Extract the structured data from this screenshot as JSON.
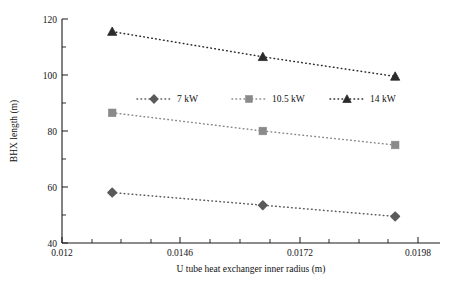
{
  "chart_data": {
    "type": "line",
    "title": "",
    "xlabel": "U tube heat exchanger inner radius (m)",
    "ylabel": "BHX length (m)",
    "x": [
      0.0131,
      0.0164,
      0.0193
    ],
    "xlim": [
      0.012,
      0.0198
    ],
    "ylim": [
      40,
      120
    ],
    "xticks": [
      "0.012",
      "0.0146",
      "0.0172",
      "0.0198"
    ],
    "xtick_values": [
      0.012,
      0.0146,
      0.0172,
      0.0198
    ],
    "yticks": [
      "40",
      "60",
      "80",
      "100",
      "120"
    ],
    "ytick_values": [
      40,
      60,
      80,
      100,
      120
    ],
    "grid": false,
    "legend_position": "center",
    "series": [
      {
        "name": "7 kW",
        "marker": "diamond",
        "color": "#5a5a5a",
        "values": [
          58,
          53.5,
          49.5
        ]
      },
      {
        "name": "10.5 kW",
        "marker": "square",
        "color": "#8a8a8a",
        "values": [
          86.5,
          80,
          75
        ]
      },
      {
        "name": "14 kW",
        "marker": "triangle",
        "color": "#2b2b2b",
        "values": [
          115.5,
          106.5,
          99.5
        ]
      }
    ]
  },
  "legend": {
    "items": [
      {
        "label": "7 kW",
        "marker": "diamond-marker-icon"
      },
      {
        "label": "10.5 kW",
        "marker": "square-marker-icon"
      },
      {
        "label": "14 kW",
        "marker": "triangle-marker-icon"
      }
    ]
  },
  "axes": {
    "x_title": "U tube heat exchanger inner radius (m)",
    "y_title": "BHX length (m)",
    "x_tick_labels": [
      "0.012",
      "0.0146",
      "0.0172",
      "0.0198"
    ],
    "y_tick_labels": [
      "120",
      "100",
      "80",
      "60",
      "40"
    ]
  },
  "colors": {
    "axis": "#1a1a1a",
    "background": "#ffffff",
    "series_7kw": "#5a5a5a",
    "series_105kw": "#8a8a8a",
    "series_14kw": "#2b2b2b"
  }
}
